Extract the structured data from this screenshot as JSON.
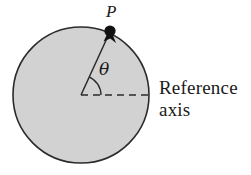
{
  "figure": {
    "name": "rotating-disk-angular-position-diagram",
    "background_color": "#ffffff",
    "disk": {
      "name": "disk",
      "fill_color": "#d2d2d2",
      "stroke_color": "#2b2b2b",
      "center_x": 81,
      "center_y": 95,
      "radius": 68,
      "stroke_width": 1.6
    },
    "reference_axis": {
      "label_line_1": "Reference",
      "label_line_2": "axis",
      "dash_color": "#2b2b2b",
      "start_x": 81,
      "start_y": 95,
      "end_x": 152,
      "end_y": 95,
      "dash_pattern": "7 5"
    },
    "radius_line": {
      "name": "radius-to-point-p",
      "color": "#2b2b2b",
      "start_x": 81,
      "start_y": 95,
      "end_x": 110,
      "end_y": 31
    },
    "point_p": {
      "label": "P",
      "marker_color": "#111111",
      "x": 110,
      "y": 31,
      "marker_radius": 5.5
    },
    "angle": {
      "symbol": "θ",
      "arc_radius": 20,
      "arc_color": "#2b2b2b",
      "degrees_from_axis": 66
    }
  }
}
